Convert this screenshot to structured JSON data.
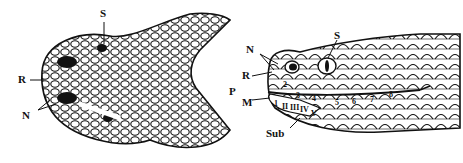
{
  "diagram": {
    "left_view": {
      "description": "Dorsal view of snake head",
      "labels": {
        "S": "S",
        "R": "R",
        "N": "N"
      }
    },
    "right_view": {
      "description": "Lateral view of snake head",
      "labels": {
        "N": "N",
        "S": "S",
        "R": "R",
        "P": "P",
        "M": "M",
        "Sub": "Sub"
      },
      "supralabials": [
        "2",
        "3",
        "4",
        "5",
        "6",
        "7",
        "8"
      ],
      "infralabials": [
        "1",
        "II",
        "III",
        "IV",
        "V"
      ]
    },
    "colors": {
      "ink": "#111111",
      "background": "#ffffff"
    }
  }
}
